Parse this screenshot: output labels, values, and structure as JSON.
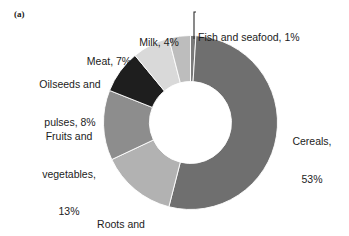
{
  "figure": {
    "panel_label": "(a)"
  },
  "chart_data": {
    "type": "pie",
    "variant": "donut",
    "title": "",
    "subtitle": "",
    "xlabel": "",
    "ylabel": "",
    "grid": false,
    "legend_position": "none",
    "labels_outside": true,
    "start_angle_deg": 0,
    "direction": "clockwise",
    "units": "percent",
    "categories": [
      "Fish and seafood",
      "Cereals",
      "Roots and tubers",
      "Fruits and vegetables",
      "Oilseeds and pulses",
      "Meat",
      "Milk"
    ],
    "values": [
      1,
      53,
      14,
      13,
      8,
      7,
      4
    ],
    "colors": [
      "#7a7a7a",
      "#6f6f6f",
      "#b2b2b2",
      "#8d8d8d",
      "#1e1e1e",
      "#d9d9d9",
      "#bdbdbd"
    ],
    "slices": [
      {
        "name": "Fish and seafood",
        "value": 1,
        "color": "#7a7a7a",
        "label": "Fish and seafood, 1%"
      },
      {
        "name": "Cereals",
        "value": 53,
        "color": "#6f6f6f",
        "label": "Cereals, 53%"
      },
      {
        "name": "Roots and tubers",
        "value": 14,
        "color": "#b2b2b2",
        "label": "Roots and tubers, 14%"
      },
      {
        "name": "Fruits and vegetables",
        "value": 13,
        "color": "#8d8d8d",
        "label": "Fruits and vegetables, 13%"
      },
      {
        "name": "Oilseeds and pulses",
        "value": 8,
        "color": "#1e1e1e",
        "label": "Oilseeds and pulses, 8%"
      },
      {
        "name": "Meat",
        "value": 7,
        "color": "#d9d9d9",
        "label": "Meat, 7%"
      },
      {
        "name": "Milk",
        "value": 4,
        "color": "#bdbdbd",
        "label": "Milk, 4%"
      }
    ]
  },
  "labels": {
    "fish": "Fish and seafood, 1%",
    "milk": "Milk, 4%",
    "meat": "Meat, 7%",
    "oilseeds_line1": "Oilseeds and",
    "oilseeds_line2": "pulses, 8%",
    "fruits_line1": "Fruits and",
    "fruits_line2": "vegetables,",
    "fruits_line3": "13%",
    "roots_line1": "Roots and",
    "roots_line2": "tubers, 14%",
    "cereals_line1": "Cereals,",
    "cereals_line2": "53%"
  },
  "geometry": {
    "center_x": 190.5,
    "center_y": 122.5,
    "outer_radius": 87,
    "inner_radius": 41
  }
}
